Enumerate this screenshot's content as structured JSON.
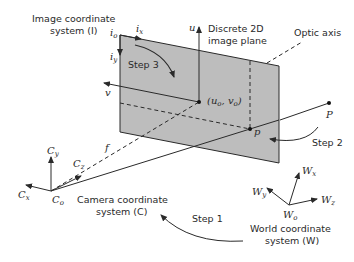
{
  "labels": {
    "image_coord_line1": "Image coordinate",
    "image_coord_line2": "system (I)",
    "discrete_line1": "Discrete 2D",
    "discrete_line2": "image plane",
    "optic_axis": "Optic axis",
    "camera_coord_line1": "Camera coordinate",
    "camera_coord_line2": "system (C)",
    "world_coord_line1": "World coordinate",
    "world_coord_line2": "system (W)",
    "step1": "Step 1",
    "step2": "Step 2",
    "step3": "Step 3"
  },
  "symbols": {
    "i": "i",
    "o": "o",
    "x": "x",
    "y": "y",
    "z": "z",
    "u": "u",
    "v": "v",
    "f": "f",
    "p": "p",
    "P": "P",
    "C": "C",
    "W": "W",
    "u0v0_open": "(u",
    "u0v0_mid": ", v",
    "u0v0_close": ")"
  },
  "colors": {
    "plane_fill": "#bdbdbd",
    "stroke": "#2a2a2a"
  }
}
